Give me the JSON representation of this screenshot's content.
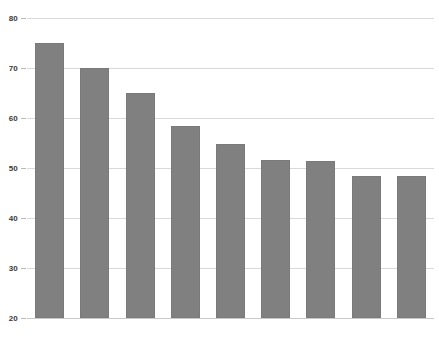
{
  "chart_data": {
    "type": "bar",
    "title": "",
    "subtitle": "",
    "xlabel": "",
    "ylabel": "",
    "categories": [
      "1907-1916",
      "1917-1926",
      "1927-1936",
      "1937-1946",
      "1947-1956",
      "1957-1966",
      "1967-1976",
      "1977-1986",
      "1987-1996"
    ],
    "values": [
      75,
      70,
      65,
      58.5,
      54.8,
      51.6,
      51.5,
      48.5,
      48.4
    ],
    "ylim": [
      20,
      80
    ],
    "ytick_labels": [
      "80",
      "70",
      "60",
      "50",
      "40",
      "30",
      "20"
    ],
    "yticks": [
      80,
      70,
      60,
      50,
      40,
      30,
      20
    ],
    "grid": true,
    "legend": false,
    "legend_position": "none",
    "series": [
      {
        "name": "",
        "values": [
          75,
          70,
          65,
          58.5,
          54.8,
          51.6,
          51.5,
          48.5,
          48.4
        ]
      }
    ],
    "colors": {
      "bar_fill": "#808080",
      "bar_border": "#7a7a7a",
      "gridline": "#d9d9d9",
      "axis_text": "#2b2b2b",
      "background": "#ffffff"
    }
  }
}
